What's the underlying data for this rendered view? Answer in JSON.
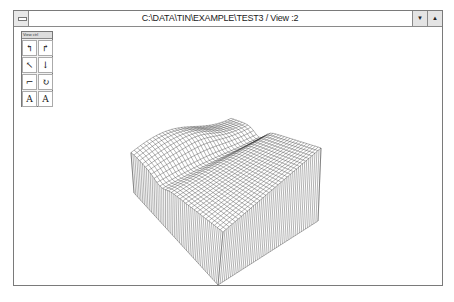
{
  "window": {
    "title": "C:\\DATA\\TIN\\EXAMPLE\\TEST3 / View :2",
    "buttons": {
      "system_menu": "system-menu",
      "minimize": "▼",
      "maximize": "▲"
    }
  },
  "toolbox": {
    "title": "View ctrl",
    "tools": [
      {
        "name": "rotate-left-tool",
        "glyph": "↰"
      },
      {
        "name": "rotate-right-tool",
        "glyph": "↱"
      },
      {
        "name": "tilt-up-tool",
        "glyph": "↖"
      },
      {
        "name": "tilt-down-tool",
        "glyph": "↓"
      },
      {
        "name": "turn-tool",
        "glyph": "⌐"
      },
      {
        "name": "spin-tool",
        "glyph": "↻"
      },
      {
        "name": "zoom-in-tool",
        "glyph": "A"
      },
      {
        "name": "zoom-out-tool",
        "glyph": "A"
      }
    ]
  },
  "view": {
    "description": "3D wireframe terrain block (TIN surface)",
    "colors": {
      "line": "#222222",
      "background": "#ffffff"
    }
  }
}
